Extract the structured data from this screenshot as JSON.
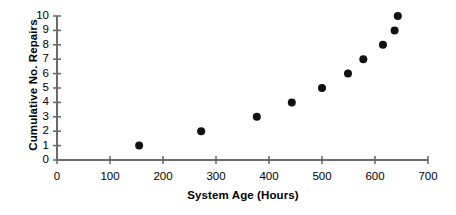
{
  "chart_data": {
    "type": "scatter",
    "title": "",
    "xlabel": "System Age (Hours)",
    "ylabel": "Cumulative No. Repairs",
    "xlim": [
      0,
      700
    ],
    "ylim": [
      0,
      10
    ],
    "xticks": [
      0,
      100,
      200,
      300,
      400,
      500,
      600,
      700
    ],
    "yticks": [
      0,
      1,
      2,
      3,
      4,
      5,
      6,
      7,
      8,
      9,
      10
    ],
    "xtick_labels": [
      "0",
      "100",
      "200",
      "300",
      "400",
      "500",
      "600",
      "700"
    ],
    "ytick_labels": [
      "0",
      "1",
      "2",
      "3",
      "4",
      "5",
      "6",
      "7",
      "8",
      "9",
      "10"
    ],
    "grid": false,
    "legend": null,
    "marker": "filled-circle",
    "marker_color": "#111111",
    "marker_size_px": 7,
    "axis_color": "#6b6b6b",
    "series": [
      {
        "name": "Cumulative repairs",
        "x": [
          155,
          272,
          377,
          443,
          500,
          549,
          578,
          615,
          637,
          643
        ],
        "y": [
          1,
          2,
          3,
          4,
          5,
          6,
          7,
          8,
          9,
          10
        ]
      }
    ]
  }
}
